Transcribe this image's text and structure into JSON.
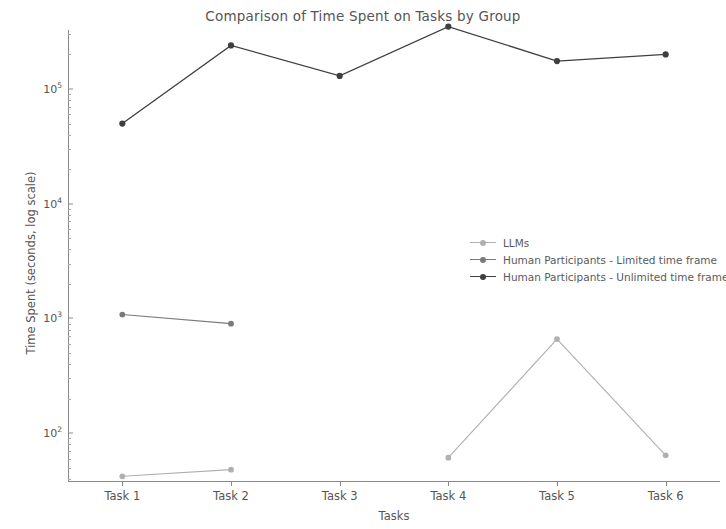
{
  "chart_data": {
    "type": "line",
    "title": "Comparison of Time Spent on Tasks by Group",
    "xlabel": "Tasks",
    "ylabel": "Time Spent (seconds, log scale)",
    "categories": [
      "Task 1",
      "Task 2",
      "Task 3",
      "Task 4",
      "Task 5",
      "Task 6"
    ],
    "yscale": "log",
    "ylim": [
      30,
      500000
    ],
    "ytick_labels": [
      "10^5",
      "10^4",
      "10^3",
      "10^2"
    ],
    "ytick_values": [
      100000,
      10000,
      1000,
      100
    ],
    "grid": false,
    "legend_position": "center right",
    "series": [
      {
        "name": "LLMs",
        "color": "#b0b0b0",
        "values": [
          42,
          48,
          null,
          61,
          660,
          64
        ]
      },
      {
        "name": "Human Participants - Limited time frame",
        "color": "#7a7a7a",
        "values": [
          1080,
          900,
          null,
          null,
          null,
          null
        ]
      },
      {
        "name": "Human Participants - Unlimited time frame",
        "color": "#3f3f3f",
        "values": [
          50000,
          240000,
          130000,
          350000,
          175000,
          200000
        ]
      }
    ]
  },
  "axes": {
    "yticks": [
      {
        "base": "10",
        "exp": "5"
      },
      {
        "base": "10",
        "exp": "4"
      },
      {
        "base": "10",
        "exp": "3"
      },
      {
        "base": "10",
        "exp": "2"
      }
    ]
  },
  "colors": {
    "axis": "#8a8a8a",
    "text": "#555555",
    "background": "#ffffff"
  }
}
